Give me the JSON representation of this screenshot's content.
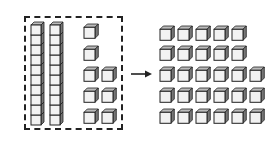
{
  "diagram": {
    "left_group": {
      "tens_rods": 2,
      "cubes_per_rod": 10,
      "ones": 8,
      "ones_layout": [
        1,
        1,
        2,
        2,
        2
      ]
    },
    "right_group": {
      "ones": 28,
      "rows": [
        5,
        5,
        6,
        6,
        6
      ]
    },
    "arrow": "right-arrow",
    "colors": {
      "cube_front": "#f2f2f2",
      "cube_top": "#bbbbbb",
      "cube_side": "#777777",
      "outline": "#222222"
    }
  }
}
